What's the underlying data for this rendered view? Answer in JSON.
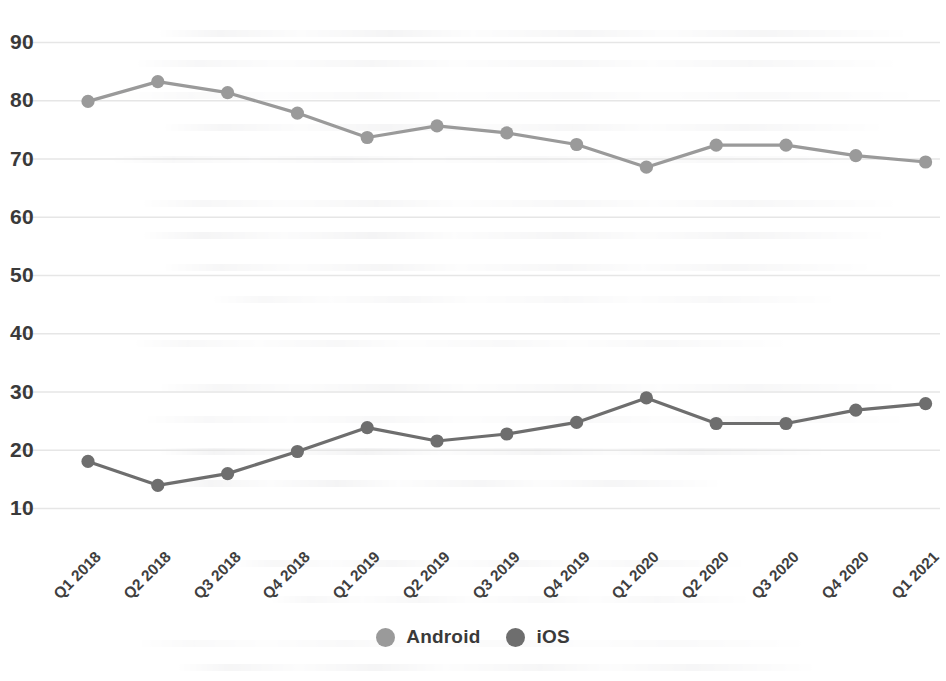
{
  "chart_data": {
    "type": "line",
    "title": "",
    "subtitle": "",
    "xlabel": "",
    "ylabel": "",
    "categories": [
      "Q1 2018",
      "Q2 2018",
      "Q3 2018",
      "Q4 2018",
      "Q1 2019",
      "Q2 2019",
      "Q3 2019",
      "Q4 2019",
      "Q1 2020",
      "Q2 2020",
      "Q3 2020",
      "Q4 2020",
      "Q1 2021"
    ],
    "series": [
      {
        "name": "Android",
        "color": "#9a9a9a",
        "values": [
          79.8,
          83.2,
          81.3,
          77.8,
          73.6,
          75.6,
          74.4,
          72.4,
          68.5,
          72.3,
          72.3,
          70.5,
          69.4
        ]
      },
      {
        "name": "iOS",
        "color": "#6e6e6e",
        "values": [
          18.0,
          13.9,
          15.9,
          19.7,
          23.8,
          21.5,
          22.7,
          24.7,
          28.9,
          24.5,
          24.5,
          26.8,
          27.9
        ]
      }
    ],
    "yticks": [
      90,
      80,
      70,
      60,
      50,
      40,
      30,
      20,
      10
    ],
    "ylim": [
      5,
      95
    ],
    "grid": true,
    "grid_color": "#e6e6e6",
    "legend_position": "bottom",
    "marker": "circle",
    "xtick_rotation": -45
  },
  "legend": {
    "items": [
      {
        "label": "Android",
        "color": "#9a9a9a"
      },
      {
        "label": "iOS",
        "color": "#6e6e6e"
      }
    ]
  }
}
